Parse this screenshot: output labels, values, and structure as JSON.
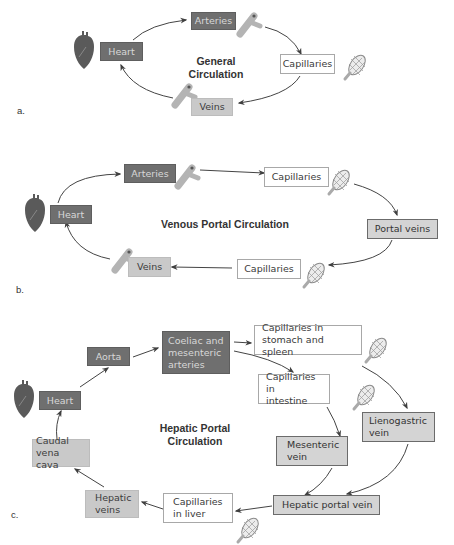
{
  "panels": {
    "a": {
      "label": "a.",
      "title_line1": "General",
      "title_line2": "Circulation",
      "nodes": {
        "heart": "Heart",
        "arteries": "Arteries",
        "capillaries": "Capillaries",
        "veins": "Veins"
      }
    },
    "b": {
      "label": "b.",
      "title": "Venous Portal Circulation",
      "nodes": {
        "heart": "Heart",
        "arteries": "Arteries",
        "capillaries_1": "Capillaries",
        "portal_veins": "Portal veins",
        "capillaries_2": "Capillaries",
        "veins": "Veins"
      }
    },
    "c": {
      "label": "c.",
      "title_line1": "Hepatic Portal",
      "title_line2": "Circulation",
      "nodes": {
        "heart": "Heart",
        "aorta": "Aorta",
        "coeliac_line1": "Coeliac and",
        "coeliac_line2": "mesenteric",
        "coeliac_line3": "arteries",
        "cap_stomach_line1": "Capillaries in",
        "cap_stomach_line2": "stomach and spleen",
        "cap_intestine_line1": "Capillaries in",
        "cap_intestine_line2": "intestine",
        "lienogastric_line1": "Lienogastric",
        "lienogastric_line2": "vein",
        "mesenteric_line1": "Mesenteric",
        "mesenteric_line2": "vein",
        "hepatic_portal": "Hepatic portal vein",
        "cap_liver_line1": "Capillaries",
        "cap_liver_line2": "in liver",
        "hepatic_veins_line1": "Hepatic",
        "hepatic_veins_line2": "veins",
        "caudal_line1": "Caudal",
        "caudal_line2": "vena cava"
      }
    }
  },
  "colors": {
    "artery": "#6f6f6f",
    "vein": "#c9c9c9",
    "portal": "#d4d4d4",
    "capillary": "#ffffff",
    "arrow": "#444444",
    "heart": "#5a5a5a",
    "vessel": "#b0b0b0"
  }
}
